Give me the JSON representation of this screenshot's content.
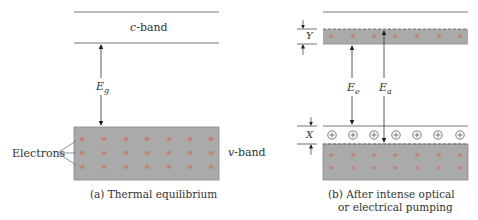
{
  "panel_a": {
    "conduction_band_label_var": "c",
    "conduction_band_label_suffix": "-band",
    "valence_band_label_var": "v",
    "valence_band_label_suffix": "-band",
    "gap_label_main": "E",
    "gap_label_sub": "g",
    "electrons_label": "Electrons",
    "caption": "(a) Thermal equilibrium",
    "electron_grid": {
      "rows": 3,
      "cols": 7
    }
  },
  "panel_b": {
    "top_region_label": "Y",
    "bottom_region_label": "X",
    "arrow1_label_main": "E",
    "arrow1_label_sub": "e",
    "arrow2_label_main": "E",
    "arrow2_label_sub": "a",
    "hole_symbol": "+",
    "caption_line1": "(b) After intense optical",
    "caption_line2": "or electrical pumping",
    "upper_electrons": {
      "rows": 1,
      "cols": 7
    },
    "holes": {
      "rows": 1,
      "cols": 7
    },
    "lower_electrons": {
      "rows": 2,
      "cols": 7
    }
  },
  "colors": {
    "band_fill": "#a9a9a9",
    "electron": "#c97a6a",
    "line": "#555555"
  }
}
